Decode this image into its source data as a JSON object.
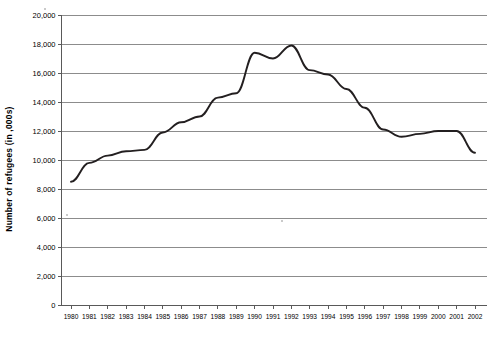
{
  "chart_data": {
    "type": "line",
    "title": "",
    "xlabel": "",
    "ylabel": "Number of refugees (in ,000s)",
    "categories": [
      "1980",
      "1981",
      "1982",
      "1983",
      "1984",
      "1985",
      "1986",
      "1987",
      "1988",
      "1989",
      "1990",
      "1991",
      "1992",
      "1993",
      "1994",
      "1995",
      "1996",
      "1997",
      "1998",
      "1999",
      "2000",
      "2001",
      "2002"
    ],
    "values": [
      8500,
      9800,
      10300,
      10600,
      10700,
      11900,
      12600,
      13000,
      14300,
      14600,
      17400,
      17000,
      17900,
      16200,
      15900,
      14900,
      13600,
      12100,
      11600,
      11800,
      12000,
      12000,
      10500
    ],
    "series": [
      {
        "name": "Number of refugees",
        "values": [
          8500,
          9800,
          10300,
          10600,
          10700,
          11900,
          12600,
          13000,
          14300,
          14600,
          17400,
          17000,
          17900,
          16200,
          15900,
          14900,
          13600,
          12100,
          11600,
          11800,
          12000,
          12000,
          10500
        ]
      }
    ],
    "ylim": [
      0,
      20000
    ],
    "yticks": [
      0,
      2000,
      4000,
      6000,
      8000,
      10000,
      12000,
      14000,
      16000,
      18000,
      20000
    ],
    "ytick_labels": [
      "0",
      "2,000",
      "4,000",
      "6,000",
      "8,000",
      "10,000",
      "12,000",
      "14,000",
      "16,000",
      "18,000",
      "20,000"
    ],
    "grid": true,
    "legend": false,
    "legend_position": "none",
    "line_color": "#231f20",
    "grid_color": "#808080",
    "axis_color": "#595959",
    "background_color": "#ffffff"
  }
}
